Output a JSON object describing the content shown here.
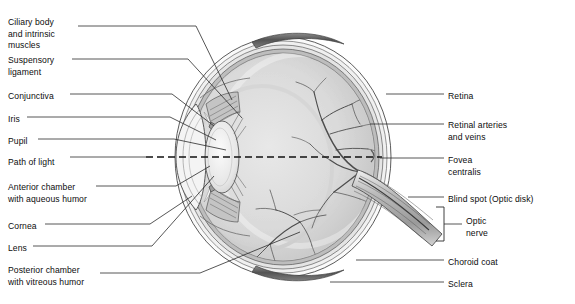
{
  "diagram": {
    "type": "anatomical-cross-section",
    "background": "#ffffff",
    "line_color": "#2b2b2b",
    "palette": {
      "sclera": "#f2f2f2",
      "choroid": "#a8a8a8",
      "retina": "#cfcfcf",
      "vitreous": "#d9d9d9",
      "lens": "#ededed",
      "muscle": "#6d6d6d",
      "optic_nerve": "#b5b5b5",
      "vessel": "#4a4a4a"
    }
  },
  "labels_left": [
    {
      "id": "ciliary-body",
      "lines": [
        "Ciliary body",
        "and intrinsic",
        "muscles"
      ],
      "x": 8,
      "y": 17
    },
    {
      "id": "suspensory-ligament",
      "lines": [
        "Suspensory",
        "ligament"
      ],
      "x": 8,
      "y": 55
    },
    {
      "id": "conjunctiva",
      "lines": [
        "Conjunctiva"
      ],
      "x": 8,
      "y": 91
    },
    {
      "id": "iris",
      "lines": [
        "Iris"
      ],
      "x": 8,
      "y": 114
    },
    {
      "id": "pupil",
      "lines": [
        "Pupil"
      ],
      "x": 8,
      "y": 136
    },
    {
      "id": "path-of-light",
      "lines": [
        "Path of light"
      ],
      "x": 8,
      "y": 157
    },
    {
      "id": "anterior-chamber",
      "lines": [
        "Anterior chamber",
        "with aqueous humor"
      ],
      "x": 8,
      "y": 182
    },
    {
      "id": "cornea",
      "lines": [
        "Cornea"
      ],
      "x": 8,
      "y": 221
    },
    {
      "id": "lens",
      "lines": [
        "Lens"
      ],
      "x": 8,
      "y": 243
    },
    {
      "id": "posterior-chamber",
      "lines": [
        "Posterior chamber",
        "with vitreous humor"
      ],
      "x": 8,
      "y": 265
    }
  ],
  "labels_right": [
    {
      "id": "retina",
      "lines": [
        "Retina"
      ],
      "x": 448,
      "y": 91
    },
    {
      "id": "retinal-vessels",
      "lines": [
        "Retinal arteries",
        "and veins"
      ],
      "x": 448,
      "y": 120
    },
    {
      "id": "fovea-centralis",
      "lines": [
        "Fovea",
        "centralis"
      ],
      "x": 448,
      "y": 155
    },
    {
      "id": "blind-spot",
      "lines": [
        "Blind spot (Optic disk)"
      ],
      "x": 448,
      "y": 194
    },
    {
      "id": "optic-nerve",
      "lines": [
        "Optic",
        "nerve"
      ],
      "x": 466,
      "y": 216
    },
    {
      "id": "choroid-coat",
      "lines": [
        "Choroid coat"
      ],
      "x": 448,
      "y": 257
    },
    {
      "id": "sclera",
      "lines": [
        "Sclera"
      ],
      "x": 448,
      "y": 279
    }
  ],
  "annotations": {
    "path_of_light_style": "dashed-horizontal",
    "optic_nerve_bracket": "square-bracket-right"
  }
}
